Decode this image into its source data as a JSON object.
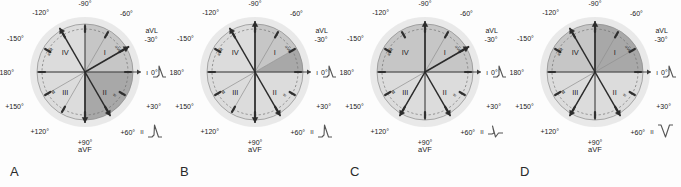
{
  "figure": {
    "type": "ecg-hexaxial-axis-diagrams",
    "panel_count": 4,
    "colors": {
      "outer_halo": "#d9d9d9",
      "circle_light": "#dcdcdc",
      "sector_mid": "#c6c6c6",
      "sector_dark": "#a8a8a8",
      "axis_line": "#3a3a3a",
      "arrow": "#2b2b2b",
      "text": "#222222",
      "background": "#fdfdfd"
    },
    "common": {
      "angle_labels": [
        {
          "text": "-90°",
          "angle": -90
        },
        {
          "text": "-120°",
          "angle": -120
        },
        {
          "text": "-150°",
          "angle": -150
        },
        {
          "text": "±180°",
          "angle": 180
        },
        {
          "text": "+150°",
          "angle": 150
        },
        {
          "text": "+120°",
          "angle": 120
        },
        {
          "text": "+90°",
          "angle": 90
        },
        {
          "text": "+60°",
          "angle": 60
        },
        {
          "text": "+30°",
          "angle": 30
        },
        {
          "text": "0°",
          "angle": 0
        },
        {
          "text": "-30°",
          "angle": -30
        },
        {
          "text": "-60°",
          "angle": -60
        }
      ],
      "quadrant_labels": [
        "I",
        "II",
        "III",
        "IV"
      ],
      "lead_labels": {
        "avl": "aVL",
        "avf": "aVF",
        "lead_one": "I",
        "lead_two": "II",
        "lead_three": "III",
        "avr": "aVR"
      },
      "arc_labels": [
        "aVR",
        "aVL",
        "III",
        "II"
      ]
    },
    "panels": [
      {
        "letter": "A",
        "name": "normal-axis",
        "axis_arrows": [
          {
            "angle": 60,
            "label": "+60°"
          },
          {
            "angle": -120,
            "label": "-120°"
          },
          {
            "angle": 90,
            "label": "+90°"
          },
          {
            "angle": -30,
            "label": "-30°"
          }
        ],
        "shaded_sectors": [
          {
            "from": -30,
            "to": 0,
            "shade": "mid"
          },
          {
            "from": 0,
            "to": 90,
            "shade": "dark"
          },
          {
            "from": -90,
            "to": -30,
            "shade": "mid"
          }
        ],
        "waveforms": {
          "lead_one": {
            "label": "I",
            "morphology": "positive"
          },
          "lead_two": {
            "label": "II",
            "morphology": "positive"
          },
          "avf": {
            "label": "aVF",
            "morphology": "positive"
          }
        }
      },
      {
        "letter": "B",
        "name": "left-axis-deviation",
        "axis_arrows": [
          {
            "angle": -90,
            "label": "-90°"
          },
          {
            "angle": -120,
            "label": "-120°"
          },
          {
            "angle": 60,
            "label": "+60°"
          },
          {
            "angle": 90,
            "label": "+90°"
          }
        ],
        "shaded_sectors": [
          {
            "from": -30,
            "to": 0,
            "shade": "dark"
          },
          {
            "from": -90,
            "to": -30,
            "shade": "mid"
          }
        ],
        "waveforms": {
          "lead_one": {
            "label": "I",
            "morphology": "positive"
          },
          "lead_two": {
            "label": "II",
            "morphology": "positive"
          },
          "avf": {
            "label": "aVF",
            "morphology": "negative"
          }
        }
      },
      {
        "letter": "C",
        "name": "borderline-left-axis",
        "axis_arrows": [
          {
            "angle": -90,
            "label": "-90°"
          },
          {
            "angle": -30,
            "label": "-30°"
          },
          {
            "angle": 60,
            "label": "+60°"
          },
          {
            "angle": 120,
            "label": "+120°"
          }
        ],
        "shaded_sectors": [
          {
            "from": -180,
            "to": 0,
            "shade": "mid"
          }
        ],
        "waveforms": {
          "lead_one": {
            "label": "I",
            "morphology": "positive"
          },
          "lead_two": {
            "label": "II",
            "morphology": "biphasic"
          },
          "avf": {
            "label": "aVF",
            "morphology": "negative"
          }
        }
      },
      {
        "letter": "D",
        "name": "marked-left-axis-deviation",
        "axis_arrows": [
          {
            "angle": -120,
            "label": "-120°"
          },
          {
            "angle": -90,
            "label": "-90°"
          },
          {
            "angle": 60,
            "label": "+60°"
          },
          {
            "angle": 120,
            "label": "+120°"
          }
        ],
        "shaded_sectors": [
          {
            "from": -90,
            "to": 0,
            "shade": "dark"
          },
          {
            "from": -180,
            "to": -90,
            "shade": "mid"
          }
        ],
        "waveforms": {
          "lead_one": {
            "label": "I",
            "morphology": "positive"
          },
          "lead_two": {
            "label": "II",
            "morphology": "negative"
          },
          "avf": {
            "label": "aVF",
            "morphology": "negative"
          }
        }
      }
    ]
  }
}
